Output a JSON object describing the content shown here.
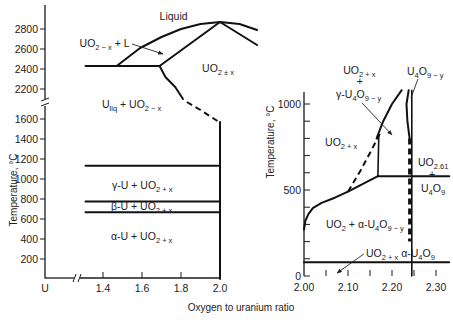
{
  "figure": {
    "xlabel": "Oxygen to uranium ratio",
    "left_ylabel": "Temperature, °C",
    "right_ylabel": "Temperature, °C"
  },
  "chart_data": [
    {
      "id": "left",
      "type": "line",
      "title": "",
      "description": "U–UO2 phase diagram (full range)",
      "xlabel": "Oxygen to uranium ratio",
      "ylabel": "Temperature, °C",
      "xlim": [
        1.0,
        2.0
      ],
      "ylim": [
        0,
        2900
      ],
      "axis_breaks": {
        "x": [
          1.0,
          1.3
        ],
        "y": [
          1700,
          2100
        ]
      },
      "grid": false,
      "x_ticks": [
        {
          "v": 1.0,
          "label": "U",
          "tick": false
        },
        {
          "v": 1.4,
          "label": "1.4",
          "tick": true
        },
        {
          "v": 1.6,
          "label": "1.6",
          "tick": true
        },
        {
          "v": 1.8,
          "label": "1.8",
          "tick": true
        },
        {
          "v": 2.0,
          "label": "2.0",
          "tick": false
        }
      ],
      "y_ticks": [
        {
          "v": 200,
          "label": "200"
        },
        {
          "v": 400,
          "label": "400"
        },
        {
          "v": 600,
          "label": "600"
        },
        {
          "v": 800,
          "label": "800"
        },
        {
          "v": 1000,
          "label": "1000"
        },
        {
          "v": 1200,
          "label": "1200"
        },
        {
          "v": 1400,
          "label": "1400"
        },
        {
          "v": 1600,
          "label": "1600"
        },
        {
          "v": 2200,
          "label": "2200"
        },
        {
          "v": 2400,
          "label": "2400"
        },
        {
          "v": 2600,
          "label": "2600"
        },
        {
          "v": 2800,
          "label": "2800"
        }
      ],
      "boundaries": [
        {
          "name": "monotectic-2430",
          "style": "solid",
          "points": [
            [
              1.31,
              2430
            ],
            [
              1.69,
              2430
            ]
          ]
        },
        {
          "name": "liquidus",
          "style": "solid",
          "points": [
            [
              1.47,
              2430
            ],
            [
              1.59,
              2610
            ],
            [
              1.7,
              2720
            ],
            [
              1.8,
              2800
            ],
            [
              1.9,
              2850
            ],
            [
              2.0,
              2870
            ],
            [
              2.1,
              2850
            ],
            [
              2.19,
              2790
            ]
          ]
        },
        {
          "name": "solidus-left",
          "style": "solid",
          "points": [
            [
              1.69,
              2430
            ],
            [
              2.0,
              2870
            ]
          ]
        },
        {
          "name": "solidus-right",
          "style": "solid",
          "points": [
            [
              2.0,
              2870
            ],
            [
              2.19,
              2640
            ]
          ]
        },
        {
          "name": "uo2-x-boundary",
          "style": "solid",
          "points": [
            [
              1.69,
              2430
            ],
            [
              1.72,
              2320
            ],
            [
              1.77,
              2220
            ],
            [
              1.81,
              2100
            ]
          ]
        },
        {
          "name": "uo2-x-boundary-estimated",
          "style": "dashed",
          "points": [
            [
              1.83,
              1770
            ],
            [
              1.9,
              1690
            ],
            [
              1.995,
              1570
            ]
          ]
        },
        {
          "name": "uo2-stoichiometric",
          "style": "solid",
          "points": [
            [
              2.0,
              1570
            ],
            [
              2.0,
              0
            ]
          ]
        },
        {
          "name": "gamma-U-1132",
          "style": "solid",
          "points": [
            [
              1.31,
              1132
            ],
            [
              2.0,
              1132
            ]
          ]
        },
        {
          "name": "beta-gamma-776",
          "style": "solid",
          "points": [
            [
              1.31,
              776
            ],
            [
              2.0,
              776
            ]
          ]
        },
        {
          "name": "alpha-beta-668",
          "style": "solid",
          "points": [
            [
              1.31,
              668
            ],
            [
              2.0,
              668
            ]
          ]
        }
      ],
      "annotations": [
        {
          "name": "label-liquid",
          "x": 1.69,
          "y": 2890,
          "segments": [
            {
              "t": "Liquid"
            }
          ]
        },
        {
          "name": "label-uo2-x-plus-l",
          "x": 1.28,
          "y": 2620,
          "segments": [
            {
              "t": "UO"
            },
            {
              "t": "2 − x",
              "sub": true
            },
            {
              "t": " + L"
            }
          ],
          "arrow": [
            [
              1.549,
              2650
            ],
            [
              1.708,
              2550
            ]
          ]
        },
        {
          "name": "label-uo2-pm-x",
          "x": 1.908,
          "y": 2370,
          "segments": [
            {
              "t": "UO"
            },
            {
              "t": "2 ± x",
              "sub": true
            }
          ]
        },
        {
          "name": "label-uliq-uo2-x",
          "x": 1.395,
          "y": 2010,
          "segments": [
            {
              "t": "U"
            },
            {
              "t": "liq",
              "sub": true
            },
            {
              "t": " + UO"
            },
            {
              "t": "2 − x",
              "sub": true
            }
          ]
        },
        {
          "name": "label-gamma-u",
          "x": 1.446,
          "y": 900,
          "segments": [
            {
              "t": "γ-U + UO"
            },
            {
              "t": "2 + x",
              "sub": true
            }
          ]
        },
        {
          "name": "label-beta-u",
          "x": 1.441,
          "y": 690,
          "segments": [
            {
              "t": "β-U + UO"
            },
            {
              "t": "2 + x",
              "sub": true
            }
          ]
        },
        {
          "name": "label-alpha-u",
          "x": 1.441,
          "y": 390,
          "segments": [
            {
              "t": "α-U + UO"
            },
            {
              "t": "2 + x",
              "sub": true
            }
          ]
        }
      ]
    },
    {
      "id": "right",
      "type": "line",
      "title": "",
      "description": "UO2–U4O9 phase diagram (detail)",
      "xlabel": "Oxygen to uranium ratio",
      "ylabel": "Temperature, °C",
      "xlim": [
        2.0,
        2.33
      ],
      "ylim": [
        0,
        1070
      ],
      "grid": false,
      "x_ticks": [
        {
          "v": 2.0,
          "label": "2.00",
          "tick": false
        },
        {
          "v": 2.05,
          "label": "",
          "tick": true
        },
        {
          "v": 2.1,
          "label": "2.10",
          "tick": true
        },
        {
          "v": 2.15,
          "label": "",
          "tick": true
        },
        {
          "v": 2.2,
          "label": "2.20",
          "tick": true
        },
        {
          "v": 2.25,
          "label": "",
          "tick": true
        },
        {
          "v": 2.3,
          "label": "2.30",
          "tick": true
        }
      ],
      "y_ticks": [
        {
          "v": 0,
          "label": "0"
        },
        {
          "v": 100,
          "label": ""
        },
        {
          "v": 200,
          "label": ""
        },
        {
          "v": 300,
          "label": ""
        },
        {
          "v": 400,
          "label": ""
        },
        {
          "v": 500,
          "label": "500"
        },
        {
          "v": 600,
          "label": ""
        },
        {
          "v": 700,
          "label": ""
        },
        {
          "v": 800,
          "label": ""
        },
        {
          "v": 900,
          "label": ""
        },
        {
          "v": 1000,
          "label": "1000"
        }
      ],
      "boundaries": [
        {
          "name": "isotherm-80",
          "style": "solid",
          "points": [
            [
              2.0,
              80
            ],
            [
              2.33,
              80
            ]
          ]
        },
        {
          "name": "eutectoid-580",
          "style": "solid",
          "points": [
            [
              2.168,
              580
            ],
            [
              2.33,
              580
            ]
          ]
        },
        {
          "name": "uo2+x-solvus-low",
          "style": "solid",
          "points": [
            [
              2.0,
              270
            ],
            [
              2.003,
              320
            ],
            [
              2.01,
              360
            ],
            [
              2.02,
              395
            ],
            [
              2.04,
              425
            ],
            [
              2.07,
              455
            ],
            [
              2.1,
              490
            ],
            [
              2.168,
              580
            ]
          ]
        },
        {
          "name": "uo2+x-solvus-estimated",
          "style": "dashed",
          "points": [
            [
              2.1,
              490
            ],
            [
              2.13,
              620
            ],
            [
              2.155,
              740
            ],
            [
              2.175,
              840
            ]
          ]
        },
        {
          "name": "gamma-boundary-vertical",
          "style": "thin",
          "points": [
            [
              2.168,
              580
            ],
            [
              2.17,
              820
            ]
          ]
        },
        {
          "name": "uo2+x-solvus-high",
          "style": "solid",
          "points": [
            [
              2.165,
              800
            ],
            [
              2.18,
              900
            ],
            [
              2.2,
              1000
            ],
            [
              2.222,
              1080
            ]
          ]
        },
        {
          "name": "u4o9-y-left-boundary",
          "style": "solid",
          "points": [
            [
              2.238,
              1080
            ],
            [
              2.233,
              1000
            ],
            [
              2.235,
              900
            ],
            [
              2.24,
              800
            ]
          ]
        },
        {
          "name": "u4o9-y-estimated",
          "style": "dashed-thick",
          "points": [
            [
              2.24,
              800
            ],
            [
              2.24,
              200
            ]
          ]
        },
        {
          "name": "u4o9-stoichiometric",
          "style": "thin",
          "points": [
            [
              2.245,
              0
            ],
            [
              2.245,
              1080
            ]
          ]
        }
      ],
      "annotations": [
        {
          "name": "label-uo2+x-top",
          "x": 2.089,
          "y": 1174,
          "segments": [
            {
              "t": "UO"
            },
            {
              "t": "2 + x",
              "sub": true
            }
          ]
        },
        {
          "name": "label-plus-top",
          "x": 2.12,
          "y": 1110,
          "segments": [
            {
              "t": "+"
            }
          ]
        },
        {
          "name": "label-gamma-u4o9-y",
          "x": 2.073,
          "y": 1035,
          "segments": [
            {
              "t": "γ-U"
            },
            {
              "t": "4",
              "sub": true
            },
            {
              "t": "O"
            },
            {
              "t": "9 − y",
              "sub": true
            }
          ],
          "arrow": [
            [
              2.132,
              1006
            ],
            [
              2.2,
              820
            ]
          ]
        },
        {
          "name": "label-u4o9-y",
          "x": 2.234,
          "y": 1169,
          "segments": [
            {
              "t": "U"
            },
            {
              "t": "4",
              "sub": true
            },
            {
              "t": "O"
            },
            {
              "t": "9 − y",
              "sub": true
            }
          ],
          "leader": [
            [
              2.259,
              1145
            ],
            [
              2.243,
              1035
            ]
          ]
        },
        {
          "name": "label-uo2+x-mid",
          "x": 2.048,
          "y": 756,
          "segments": [
            {
              "t": "UO"
            },
            {
              "t": "2 + x",
              "sub": true
            }
          ]
        },
        {
          "name": "label-uo2.61",
          "x": 2.259,
          "y": 640,
          "segments": [
            {
              "t": "UO"
            },
            {
              "t": "2.61",
              "sub": true
            }
          ]
        },
        {
          "name": "label-plus-right",
          "x": 2.284,
          "y": 570,
          "segments": [
            {
              "t": "+"
            }
          ]
        },
        {
          "name": "label-u4o9",
          "x": 2.266,
          "y": 488,
          "segments": [
            {
              "t": "U"
            },
            {
              "t": "4",
              "sub": true
            },
            {
              "t": "O"
            },
            {
              "t": "9",
              "sub": true
            }
          ]
        },
        {
          "name": "label-uo2-alpha-u4o9-y",
          "x": 2.05,
          "y": 279,
          "segments": [
            {
              "t": "UO"
            },
            {
              "t": "2",
              "sub": true
            },
            {
              "t": " + α-U"
            },
            {
              "t": "4",
              "sub": true
            },
            {
              "t": "O"
            },
            {
              "t": "9 − y",
              "sub": true
            }
          ]
        },
        {
          "name": "label-uo2+x-alpha-u4o9",
          "x": 2.141,
          "y": 110,
          "segments": [
            {
              "t": "UO"
            },
            {
              "t": "2 + x",
              "sub": true
            },
            {
              "t": " α-U"
            },
            {
              "t": "4",
              "sub": true
            },
            {
              "t": "O"
            },
            {
              "t": "9",
              "sub": true
            }
          ],
          "arrow": [
            [
              2.136,
              128
            ],
            [
              2.075,
              17
            ]
          ]
        }
      ]
    }
  ]
}
